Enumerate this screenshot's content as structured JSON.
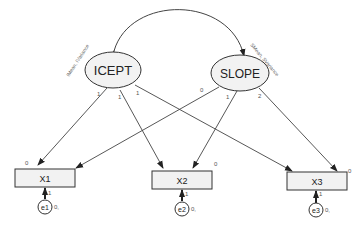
{
  "diagram": {
    "type": "latent growth curve model",
    "latent_variables": [
      {
        "id": "icept",
        "label": "ICEPT",
        "annotation": "IMean, IVariance"
      },
      {
        "id": "slope",
        "label": "SLOPE",
        "annotation": "SMean, SVariance"
      }
    ],
    "observed_variables": [
      {
        "id": "x1",
        "label": "X1",
        "intercept": "0"
      },
      {
        "id": "x2",
        "label": "X2",
        "intercept": "0"
      },
      {
        "id": "x3",
        "label": "X3",
        "intercept": "0"
      }
    ],
    "error_terms": [
      {
        "id": "e1",
        "label": "e1",
        "mean": "0,",
        "loading": "1"
      },
      {
        "id": "e2",
        "label": "e2",
        "mean": "0,",
        "loading": "1"
      },
      {
        "id": "e3",
        "label": "e3",
        "mean": "0,",
        "loading": "1"
      }
    ],
    "paths": [
      {
        "from": "ICEPT",
        "to": "X1",
        "weight": "1"
      },
      {
        "from": "ICEPT",
        "to": "X2",
        "weight": "1"
      },
      {
        "from": "ICEPT",
        "to": "X3",
        "weight": "1"
      },
      {
        "from": "SLOPE",
        "to": "X1",
        "weight": "0"
      },
      {
        "from": "SLOPE",
        "to": "X2",
        "weight": "1"
      },
      {
        "from": "SLOPE",
        "to": "X3",
        "weight": "2"
      }
    ],
    "covariance": {
      "between": [
        "ICEPT",
        "SLOPE"
      ]
    }
  }
}
